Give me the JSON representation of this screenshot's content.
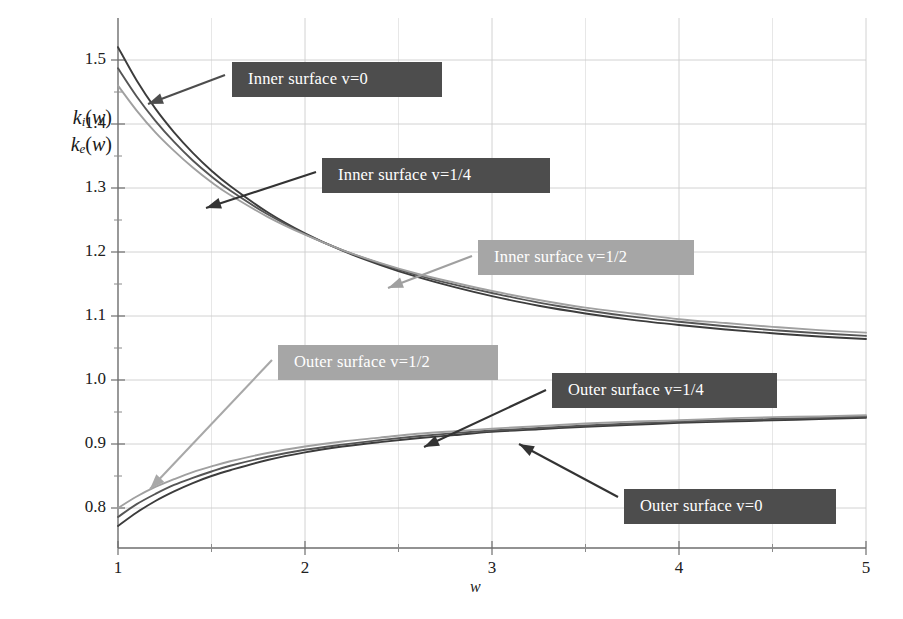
{
  "chart_data": {
    "type": "line",
    "title": "",
    "xlabel": "w",
    "ylabel_lines": [
      "k_i(w)",
      "k_e(w)"
    ],
    "xlim": [
      1,
      5
    ],
    "ylim": [
      0.755,
      1.545
    ],
    "xticks": [
      1,
      2,
      3,
      4,
      5
    ],
    "xtick_labels": [
      "1",
      "2",
      "3",
      "4",
      "5"
    ],
    "yticks": [
      0.8,
      0.9,
      1.0,
      1.1,
      1.2,
      1.3,
      1.4,
      1.5
    ],
    "ytick_labels": [
      "0.8",
      "0.9",
      "1.0",
      "1.1",
      "1.2",
      "1.3",
      "1.4",
      "1.5"
    ],
    "x_minor_ticks": [
      1.5,
      2.5,
      3.5,
      4.5
    ],
    "y_minor_ticks": [
      0.85,
      0.95,
      1.05,
      1.15,
      1.25,
      1.35,
      1.45
    ],
    "grid": true,
    "grid_color": "#cccccc",
    "legend_position": "inline-callouts",
    "x": [
      1.0,
      1.1,
      1.2,
      1.3,
      1.4,
      1.5,
      1.6,
      1.8,
      2.0,
      2.2,
      2.4,
      2.6,
      2.8,
      3.0,
      3.25,
      3.5,
      3.75,
      4.0,
      4.25,
      4.5,
      4.75,
      5.0
    ],
    "series": [
      {
        "name": "Inner surface v=0",
        "color": "#3c3c3c",
        "values": [
          1.52,
          1.468,
          1.424,
          1.387,
          1.355,
          1.327,
          1.303,
          1.262,
          1.229,
          1.202,
          1.18,
          1.161,
          1.145,
          1.131,
          1.116,
          1.104,
          1.094,
          1.086,
          1.079,
          1.073,
          1.068,
          1.064
        ]
      },
      {
        "name": "Inner surface v=1/4",
        "color": "#555555",
        "values": [
          1.487,
          1.443,
          1.405,
          1.372,
          1.343,
          1.318,
          1.296,
          1.259,
          1.228,
          1.203,
          1.182,
          1.164,
          1.149,
          1.136,
          1.121,
          1.109,
          1.099,
          1.091,
          1.084,
          1.078,
          1.073,
          1.069
        ]
      },
      {
        "name": "Inner surface v=1/2",
        "color": "#a0a0a0",
        "values": [
          1.46,
          1.421,
          1.387,
          1.358,
          1.332,
          1.309,
          1.289,
          1.255,
          1.227,
          1.203,
          1.183,
          1.166,
          1.152,
          1.139,
          1.125,
          1.113,
          1.104,
          1.095,
          1.089,
          1.083,
          1.078,
          1.074
        ]
      },
      {
        "name": "Outer surface v=0",
        "color": "#3c3c3c",
        "values": [
          0.772,
          0.793,
          0.811,
          0.826,
          0.839,
          0.85,
          0.859,
          0.875,
          0.887,
          0.896,
          0.903,
          0.909,
          0.914,
          0.919,
          0.923,
          0.927,
          0.93,
          0.933,
          0.935,
          0.937,
          0.939,
          0.941
        ]
      },
      {
        "name": "Outer surface v=1/4",
        "color": "#555555",
        "values": [
          0.786,
          0.806,
          0.822,
          0.836,
          0.847,
          0.857,
          0.866,
          0.88,
          0.891,
          0.899,
          0.906,
          0.912,
          0.917,
          0.921,
          0.925,
          0.929,
          0.932,
          0.935,
          0.937,
          0.939,
          0.941,
          0.943
        ]
      },
      {
        "name": "Outer surface v=1/2",
        "color": "#a0a0a0",
        "values": [
          0.8,
          0.818,
          0.833,
          0.845,
          0.856,
          0.865,
          0.873,
          0.886,
          0.896,
          0.904,
          0.91,
          0.916,
          0.92,
          0.924,
          0.928,
          0.932,
          0.935,
          0.937,
          0.94,
          0.942,
          0.943,
          0.945
        ]
      }
    ],
    "annotations": [
      {
        "text": "Inner surface v=0",
        "style": "dark",
        "box_x": 232,
        "box_y": 62,
        "box_w": 210,
        "arrow_from_x": 225,
        "arrow_from_y": 75,
        "arrow_to_x": 148,
        "arrow_to_y": 104,
        "arrow_color": "#4d4d4d"
      },
      {
        "text": "Inner surface v=1/4",
        "style": "dark",
        "box_x": 322,
        "box_y": 158,
        "box_w": 228,
        "arrow_from_x": 316,
        "arrow_from_y": 172,
        "arrow_to_x": 206,
        "arrow_to_y": 208,
        "arrow_color": "#333333"
      },
      {
        "text": "Inner surface v=1/2",
        "style": "light",
        "box_x": 478,
        "box_y": 240,
        "box_w": 216,
        "arrow_from_x": 472,
        "arrow_from_y": 256,
        "arrow_to_x": 388,
        "arrow_to_y": 288,
        "arrow_color": "#a0a0a0"
      },
      {
        "text": "Outer surface v=1/2",
        "style": "light",
        "box_x": 278,
        "box_y": 345,
        "box_w": 220,
        "arrow_from_x": 272,
        "arrow_from_y": 360,
        "arrow_to_x": 150,
        "arrow_to_y": 489,
        "arrow_color": "#a8a8a8"
      },
      {
        "text": "Outer surface v=1/4",
        "style": "dark",
        "box_x": 552,
        "box_y": 373,
        "box_w": 225,
        "arrow_from_x": 546,
        "arrow_from_y": 390,
        "arrow_to_x": 424,
        "arrow_to_y": 447,
        "arrow_color": "#333333"
      },
      {
        "text": "Outer surface v=0",
        "style": "dark",
        "box_x": 624,
        "box_y": 489,
        "box_w": 212,
        "arrow_from_x": 618,
        "arrow_from_y": 497,
        "arrow_to_x": 519,
        "arrow_to_y": 444,
        "arrow_color": "#333333"
      }
    ]
  }
}
